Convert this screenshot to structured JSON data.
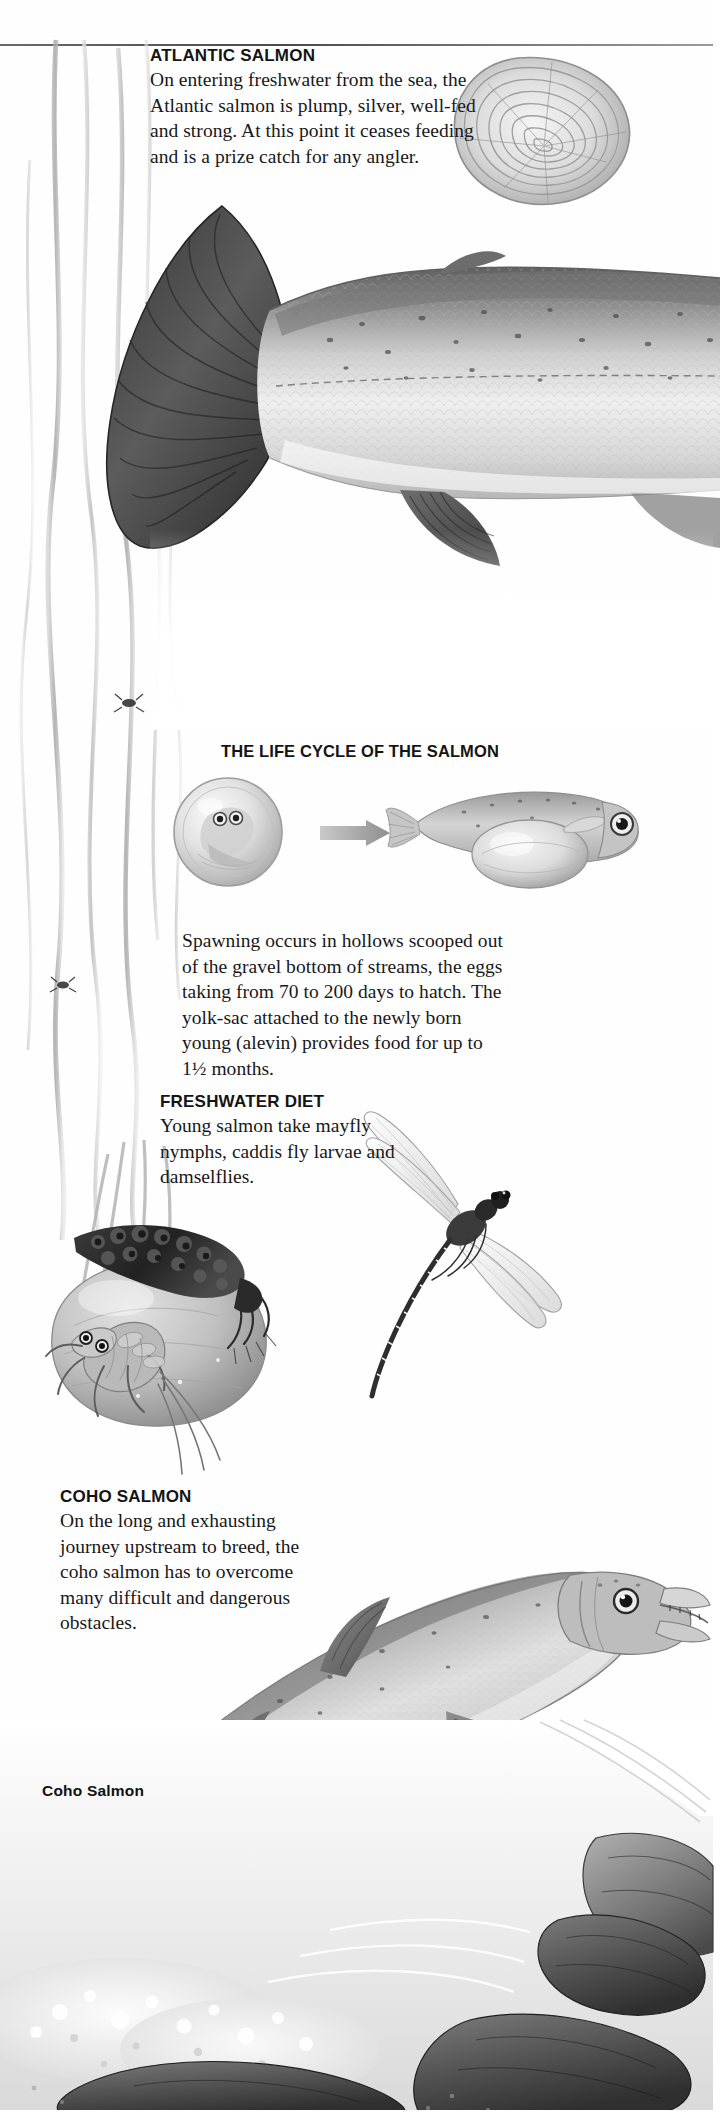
{
  "page": {
    "background_color": "#fefefe",
    "text_color": "#18181a"
  },
  "sections": [
    {
      "id": "atlantic-salmon",
      "heading": "ATLANTIC SALMON",
      "body": "On entering freshwater from the sea, the Atlantic salmon is plump, silver, well-fed and strong. At this point it ceases feeding and is a prize catch for any angler."
    },
    {
      "id": "life-cycle",
      "heading": "THE LIFE CYCLE OF THE SALMON",
      "body": "Spawning occurs in hollows scooped out of the gravel bottom of streams, the eggs taking from 70 to 200 days to hatch. The yolk-sac attached to the newly born young (alevin) provides food for up to 1½ months."
    },
    {
      "id": "freshwater-diet",
      "heading": "FRESHWATER DIET",
      "body": "Young salmon take mayfly nymphs, caddis fly larvae and damselflies."
    },
    {
      "id": "coho-salmon",
      "heading": "COHO SALMON",
      "body": "On the long and exhausting journey upstream to breed, the coho salmon has to overcome many difficult and dangerous obstacles."
    }
  ],
  "captions": [
    {
      "id": "coho-salmon-caption",
      "label": "Coho Salmon"
    }
  ],
  "illustrations": [
    {
      "id": "salmon-scale",
      "label": "salmon scale growth rings"
    },
    {
      "id": "atlantic-salmon-body",
      "label": "Atlantic salmon tail and body"
    },
    {
      "id": "salmon-egg",
      "label": "salmon egg with developing embryo"
    },
    {
      "id": "arrow",
      "label": "process arrow"
    },
    {
      "id": "alevin",
      "label": "alevin with yolk-sac"
    },
    {
      "id": "caddis-larva",
      "label": "caddis fly larva on rock"
    },
    {
      "id": "mayfly-nymph",
      "label": "mayfly nymph"
    },
    {
      "id": "river-stone",
      "label": "river stone"
    },
    {
      "id": "damselfly",
      "label": "damselfly"
    },
    {
      "id": "weed-stems",
      "label": "trailing water weed stems"
    },
    {
      "id": "coho-salmon-leaping",
      "label": "coho salmon leaping upstream"
    },
    {
      "id": "river-rocks",
      "label": "river bed rocks and rapids"
    }
  ]
}
